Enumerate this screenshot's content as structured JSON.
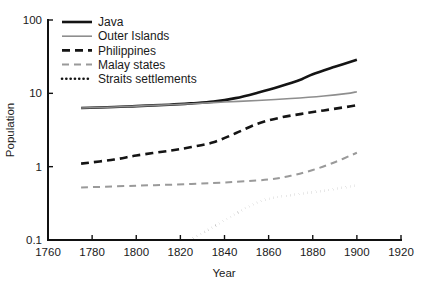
{
  "chart_data": {
    "type": "line",
    "title": "",
    "xlabel": "Year",
    "ylabel": "Population",
    "yscale": "log",
    "xlim": [
      1760,
      1920
    ],
    "ylim": [
      0.1,
      100
    ],
    "grid": false,
    "legend_position": "top-left",
    "xticks": [
      1760,
      1780,
      1800,
      1820,
      1840,
      1860,
      1880,
      1900,
      1920
    ],
    "yticks": [
      0.1,
      1,
      10,
      100
    ],
    "ytick_labels": [
      "0.1",
      "1",
      "10",
      "100"
    ],
    "series": [
      {
        "name": "Java",
        "color": "#141414",
        "style": "solid",
        "width": 2.6,
        "points": [
          [
            1775,
            6.3
          ],
          [
            1790,
            6.5
          ],
          [
            1800,
            6.7
          ],
          [
            1815,
            7.0
          ],
          [
            1825,
            7.3
          ],
          [
            1835,
            7.7
          ],
          [
            1845,
            8.6
          ],
          [
            1855,
            10.2
          ],
          [
            1865,
            12.4
          ],
          [
            1875,
            15.6
          ],
          [
            1880,
            18.2
          ],
          [
            1890,
            23.0
          ],
          [
            1900,
            28.8
          ]
        ]
      },
      {
        "name": "Outer Islands",
        "color": "#8e8e8e",
        "style": "solid",
        "width": 1.6,
        "points": [
          [
            1775,
            6.3
          ],
          [
            1790,
            6.5
          ],
          [
            1800,
            6.7
          ],
          [
            1815,
            7.0
          ],
          [
            1825,
            7.2
          ],
          [
            1840,
            7.6
          ],
          [
            1855,
            8.0
          ],
          [
            1870,
            8.5
          ],
          [
            1885,
            9.2
          ],
          [
            1895,
            9.9
          ],
          [
            1900,
            10.5
          ]
        ]
      },
      {
        "name": "Philippines",
        "color": "#141414",
        "style": "dashed",
        "width": 2.6,
        "points": [
          [
            1775,
            1.1
          ],
          [
            1790,
            1.25
          ],
          [
            1800,
            1.42
          ],
          [
            1815,
            1.65
          ],
          [
            1825,
            1.85
          ],
          [
            1835,
            2.15
          ],
          [
            1845,
            2.85
          ],
          [
            1855,
            3.85
          ],
          [
            1865,
            4.65
          ],
          [
            1875,
            5.25
          ],
          [
            1885,
            5.85
          ],
          [
            1895,
            6.5
          ],
          [
            1900,
            6.9
          ]
        ]
      },
      {
        "name": "Malay states",
        "color": "#9a9a9a",
        "style": "dashed",
        "width": 2.0,
        "points": [
          [
            1775,
            0.52
          ],
          [
            1800,
            0.55
          ],
          [
            1825,
            0.58
          ],
          [
            1845,
            0.62
          ],
          [
            1860,
            0.67
          ],
          [
            1870,
            0.75
          ],
          [
            1880,
            0.9
          ],
          [
            1890,
            1.15
          ],
          [
            1900,
            1.55
          ]
        ]
      },
      {
        "name": "Straits settlements",
        "color": "#141414",
        "style": "dotted",
        "width": 2.6,
        "points": [
          [
            1824,
            0.1
          ],
          [
            1832,
            0.135
          ],
          [
            1840,
            0.185
          ],
          [
            1848,
            0.255
          ],
          [
            1856,
            0.335
          ],
          [
            1864,
            0.385
          ],
          [
            1874,
            0.425
          ],
          [
            1884,
            0.465
          ],
          [
            1894,
            0.52
          ],
          [
            1900,
            0.555
          ]
        ]
      }
    ]
  },
  "legend": {
    "items": [
      {
        "label": "Java"
      },
      {
        "label": "Outer Islands"
      },
      {
        "label": "Philippines"
      },
      {
        "label": "Malay states"
      },
      {
        "label": "Straits settlements"
      }
    ]
  },
  "axes": {
    "x_title": "Year",
    "y_title": "Population",
    "x_tick_labels": [
      "1760",
      "1780",
      "1800",
      "1820",
      "1840",
      "1860",
      "1880",
      "1900",
      "1920"
    ],
    "y_tick_labels": [
      "100",
      "10",
      "1",
      "0.1"
    ]
  }
}
